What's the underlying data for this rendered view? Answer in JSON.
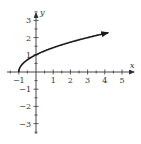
{
  "chart_data": {
    "type": "line",
    "title": "",
    "function": "y = sqrt(x + 1)",
    "xlabel": "x",
    "ylabel": "y",
    "xlim": [
      -1,
      5
    ],
    "ylim": [
      -3,
      3
    ],
    "x_ticks": [
      "-1",
      "1",
      "2",
      "3",
      "4",
      "5"
    ],
    "y_ticks": [
      "3",
      "2",
      "1",
      "-1",
      "-2",
      "-3"
    ],
    "grid": false,
    "legend": null,
    "series": [
      {
        "name": "y = sqrt(x+1)",
        "x": [
          -1,
          -0.75,
          -0.5,
          0,
          0.5,
          1,
          1.5,
          2,
          2.5,
          3,
          3.5,
          4,
          4.5,
          5
        ],
        "values": [
          0,
          0.5,
          0.707,
          1,
          1.225,
          1.414,
          1.581,
          1.732,
          1.871,
          2,
          2.121,
          2.236,
          2.345,
          2.449
        ],
        "start_point": [
          -1,
          0
        ],
        "end_arrow": true
      }
    ],
    "colors": {
      "axis": "#333333",
      "curve": "#1a1a1a"
    }
  }
}
